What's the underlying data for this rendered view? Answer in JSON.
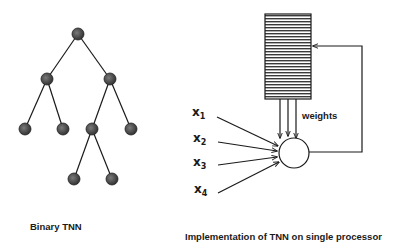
{
  "left_diagram": {
    "caption": "Binary TNN",
    "node_color": "#4a4a4a",
    "nodes": [
      {
        "id": "root",
        "x": 78,
        "y": 34
      },
      {
        "id": "l",
        "x": 47,
        "y": 79
      },
      {
        "id": "r",
        "x": 110,
        "y": 79
      },
      {
        "id": "ll",
        "x": 25,
        "y": 129
      },
      {
        "id": "lr",
        "x": 63,
        "y": 129
      },
      {
        "id": "rl",
        "x": 92,
        "y": 129
      },
      {
        "id": "rr",
        "x": 131,
        "y": 129
      },
      {
        "id": "rll",
        "x": 74,
        "y": 179
      },
      {
        "id": "rlr",
        "x": 112,
        "y": 179
      }
    ],
    "edges": [
      [
        "root",
        "l"
      ],
      [
        "root",
        "r"
      ],
      [
        "l",
        "ll"
      ],
      [
        "l",
        "lr"
      ],
      [
        "r",
        "rl"
      ],
      [
        "r",
        "rr"
      ],
      [
        "rl",
        "rll"
      ],
      [
        "rl",
        "rlr"
      ]
    ]
  },
  "right_diagram": {
    "caption": "Implementation of TNN on single processor",
    "weights_label": "weights",
    "inputs": [
      {
        "name": "x",
        "sub": "1"
      },
      {
        "name": "x",
        "sub": "2"
      },
      {
        "name": "x",
        "sub": "3"
      },
      {
        "name": "x",
        "sub": "4"
      }
    ]
  }
}
